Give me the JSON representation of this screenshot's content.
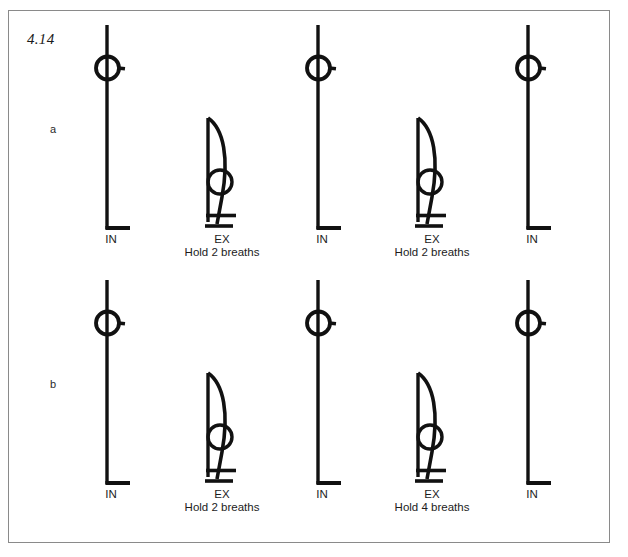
{
  "figure": {
    "number": "4.14",
    "border_color": "#8a8a8a",
    "ink_color": "#111111",
    "background": "#ffffff"
  },
  "rows": [
    {
      "label": "a",
      "cells": [
        {
          "pose": "standing",
          "main": "IN",
          "sub": ""
        },
        {
          "pose": "bending",
          "main": "EX",
          "sub": "Hold 2 breaths"
        },
        {
          "pose": "standing",
          "main": "IN",
          "sub": ""
        },
        {
          "pose": "bending",
          "main": "EX",
          "sub": "Hold 2 breaths"
        },
        {
          "pose": "standing",
          "main": "IN",
          "sub": ""
        }
      ]
    },
    {
      "label": "b",
      "cells": [
        {
          "pose": "standing",
          "main": "IN",
          "sub": ""
        },
        {
          "pose": "bending",
          "main": "EX",
          "sub": "Hold 2 breaths"
        },
        {
          "pose": "standing",
          "main": "IN",
          "sub": ""
        },
        {
          "pose": "bending",
          "main": "EX",
          "sub": "Hold 4 breaths"
        },
        {
          "pose": "standing",
          "main": "IN",
          "sub": ""
        }
      ]
    }
  ]
}
